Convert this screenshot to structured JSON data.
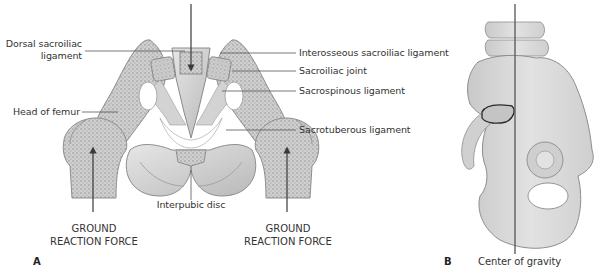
{
  "figure_a": {
    "panel_label": "A",
    "labels": {
      "dorsal_sacroiliac_line1": "Dorsal sacroiliac",
      "dorsal_sacroiliac_line2": "ligament",
      "head_of_femur": "Head of femur",
      "interosseous_sacroiliac": "Interosseous sacroiliac ligament",
      "sacroiliac_joint": "Sacroiliac joint",
      "sacrospinous": "Sacrospinous ligament",
      "sacrotuberous": "Sacrotuberous ligament",
      "interpubic_disc": "Interpubic disc"
    },
    "force_left": {
      "line1": "GROUND",
      "line2": "REACTION FORCE"
    },
    "force_right": {
      "line1": "GROUND",
      "line2": "REACTION FORCE"
    }
  },
  "figure_b": {
    "panel_label": "B",
    "center_of_gravity": "Center of gravity"
  },
  "colors": {
    "background": "#ffffff",
    "bone_fill": "#d9d9d9",
    "bone_dark": "#a8a8a8",
    "cancellous": "#bdbdbd",
    "leader_line": "#555555",
    "arrow": "#3a3a3a",
    "text": "#333333"
  }
}
